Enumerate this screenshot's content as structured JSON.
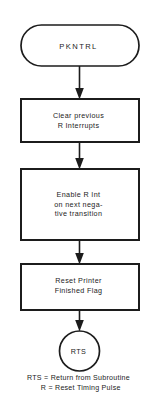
{
  "diagram": {
    "colors": {
      "stroke": "#1c1c1c",
      "fill": "#ffffff",
      "background": "#ffffff",
      "text": "#1c1c1c"
    },
    "nodes": [
      {
        "id": "start",
        "shape": "terminal-rounded",
        "label": "PKNTRL",
        "lines": [
          "PKNTRL"
        ]
      },
      {
        "id": "clear-interrupts",
        "shape": "process-rectangle",
        "label": "Clear previous R Interrupts",
        "lines": [
          "Clear previous",
          "R Interrupts"
        ]
      },
      {
        "id": "enable-interrupt",
        "shape": "process-rectangle",
        "label": "Enable R Int on next negative transition",
        "lines": [
          "Enable R Int",
          "on next nega-",
          "tive transition"
        ]
      },
      {
        "id": "reset-flag",
        "shape": "process-rectangle",
        "label": "Reset Printer Finished Flag",
        "lines": [
          "Reset Printer",
          "Finished Flag"
        ]
      },
      {
        "id": "end",
        "shape": "terminal-circle",
        "label": "RTS",
        "lines": [
          "RTS"
        ]
      }
    ],
    "connectors": [
      {
        "id": "start-to-clear",
        "from": "start",
        "to": "clear-interrupts",
        "arrow": "filled-triangle"
      },
      {
        "id": "clear-to-enable",
        "from": "clear-interrupts",
        "to": "enable-interrupt",
        "arrow": "filled-triangle"
      },
      {
        "id": "enable-to-reset",
        "from": "enable-interrupt",
        "to": "reset-flag",
        "arrow": "filled-triangle"
      },
      {
        "id": "reset-to-end",
        "from": "reset-flag",
        "to": "end",
        "arrow": "filled-triangle"
      }
    ],
    "legend": [
      {
        "id": "rts",
        "abbr": "RTS",
        "equals": "=",
        "meaning": "Return from Subroutine",
        "text": "RTS = Return from Subroutine"
      },
      {
        "id": "r",
        "abbr": "R",
        "equals": "=",
        "meaning": "Reset Timing Pulse",
        "text": "  R = Reset Timing Pulse"
      }
    ]
  }
}
